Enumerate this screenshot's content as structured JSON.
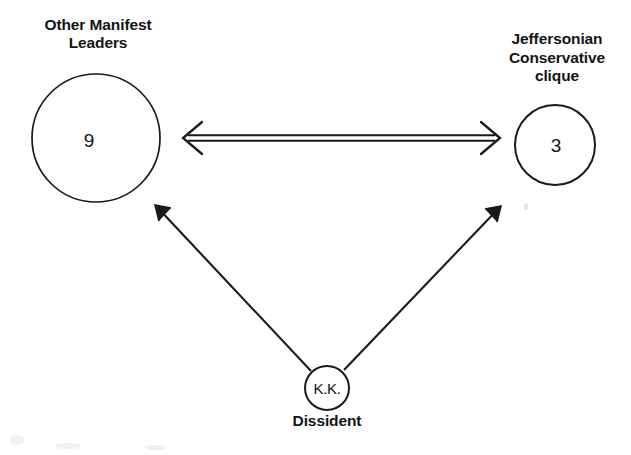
{
  "diagram": {
    "type": "sociogram",
    "background_color": "#ffffff",
    "stroke_color": "#1a1a1a",
    "nodes": [
      {
        "id": "other-manifest-leaders",
        "label": "Other Manifest\nLeaders",
        "value": "9",
        "shape": "circle",
        "cx": 96,
        "cy": 138,
        "r": 64
      },
      {
        "id": "jeffersonian-conservative-clique",
        "label": "Jeffersonian\nConservative\nclique",
        "value": "3",
        "shape": "circle",
        "cx": 555,
        "cy": 145,
        "r": 40
      },
      {
        "id": "dissident",
        "label": "Dissident",
        "value": "K.K.",
        "shape": "circle",
        "cx": 327,
        "cy": 388,
        "r": 22
      }
    ],
    "edges": [
      {
        "id": "edge-leaders-clique",
        "from": "other-manifest-leaders",
        "to": "jeffersonian-conservative-clique",
        "style": "double-line",
        "direction": "bidirectional"
      },
      {
        "id": "edge-dissident-leaders",
        "from": "dissident",
        "to": "other-manifest-leaders",
        "style": "single-line",
        "direction": "forward"
      },
      {
        "id": "edge-dissident-clique",
        "from": "dissident",
        "to": "jeffersonian-conservative-clique",
        "style": "single-line",
        "direction": "forward"
      }
    ]
  }
}
